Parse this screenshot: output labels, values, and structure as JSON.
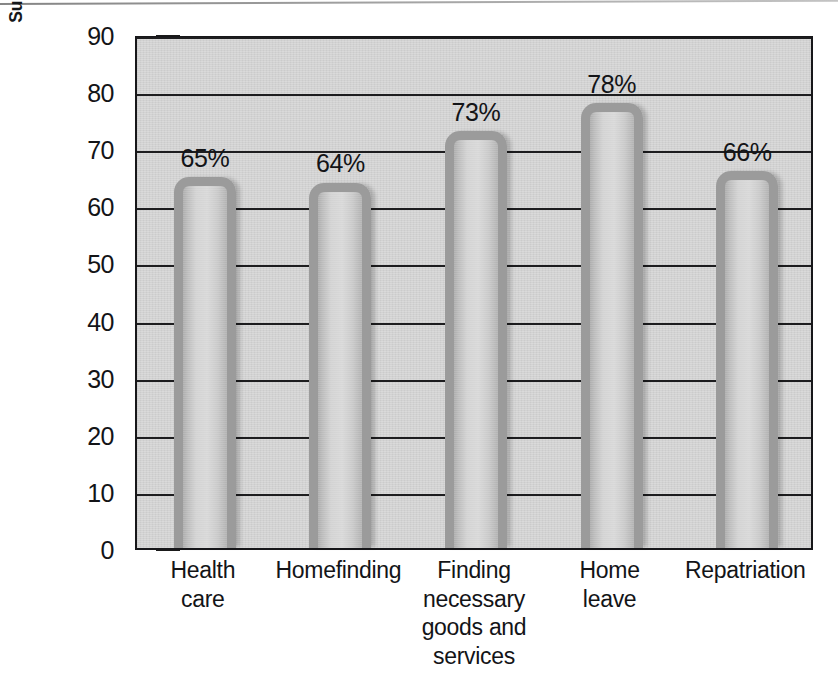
{
  "chart_data": {
    "type": "bar",
    "title": "",
    "xlabel": "",
    "ylabel": "Support Needs in Order of Importance to Employees",
    "categories": [
      "Health care",
      "Homefinding",
      "Finding necessary goods and services",
      "Home leave",
      "Repatriation"
    ],
    "category_lines": [
      [
        "Health",
        "care"
      ],
      [
        "Homefinding"
      ],
      [
        "Finding necessary",
        "goods and",
        "services"
      ],
      [
        "Home",
        "leave"
      ],
      [
        "Repatriation"
      ]
    ],
    "values": [
      65,
      64,
      73,
      78,
      66
    ],
    "data_labels": [
      "65%",
      "64%",
      "73%",
      "78%",
      "66%"
    ],
    "ylim": [
      0,
      90
    ],
    "ytick_values": [
      0,
      10,
      20,
      30,
      40,
      50,
      60,
      70,
      80,
      90
    ],
    "ytick_labels": [
      "0",
      "10",
      "20",
      "30",
      "40",
      "50",
      "60",
      "70",
      "80",
      "90"
    ],
    "grid": true,
    "grid_axis": "y",
    "legend": false,
    "legend_position": "none",
    "units": "percent",
    "colors": {
      "plot_background": "#d2d2d2",
      "page_background": "#ffffff",
      "bar_outline": "#9b9b9b",
      "bar_fill": "#d3d3d3",
      "axis": "#17171a",
      "gridline": "#1d1d1f",
      "text": "#131417"
    }
  }
}
